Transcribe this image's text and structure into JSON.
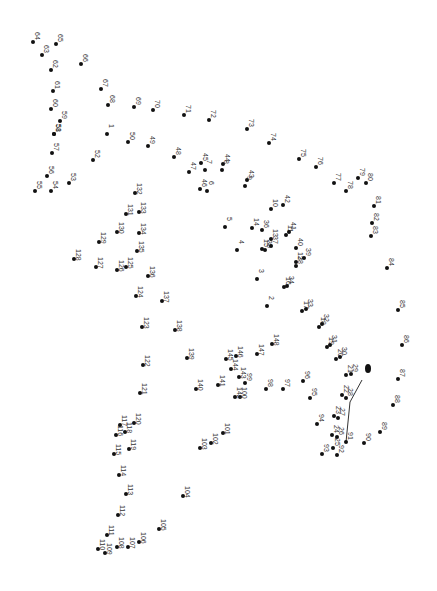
{
  "puzzle": {
    "type": "connect-the-dots",
    "dots": [
      {
        "n": "1",
        "x": 107,
        "y": 134
      },
      {
        "n": "2",
        "x": 267,
        "y": 306
      },
      {
        "n": "3",
        "x": 257,
        "y": 279
      },
      {
        "n": "4",
        "x": 237,
        "y": 250
      },
      {
        "n": "5",
        "x": 225,
        "y": 227
      },
      {
        "n": "6",
        "x": 207,
        "y": 191
      },
      {
        "n": "7",
        "x": 205,
        "y": 170
      },
      {
        "n": "8",
        "x": 222,
        "y": 170
      },
      {
        "n": "9",
        "x": 245,
        "y": 186
      },
      {
        "n": "10",
        "x": 271,
        "y": 209
      },
      {
        "n": "11",
        "x": 286,
        "y": 235
      },
      {
        "n": "12",
        "x": 296,
        "y": 262
      },
      {
        "n": "13",
        "x": 271,
        "y": 239
      },
      {
        "n": "14",
        "x": 252,
        "y": 228
      },
      {
        "n": "15",
        "x": 262,
        "y": 249
      },
      {
        "n": "16",
        "x": 284,
        "y": 287
      },
      {
        "n": "17",
        "x": 302,
        "y": 311
      },
      {
        "n": "18",
        "x": 319,
        "y": 327
      },
      {
        "n": "19",
        "x": 327,
        "y": 347
      },
      {
        "n": "20",
        "x": 336,
        "y": 359
      },
      {
        "n": "21",
        "x": 346,
        "y": 375
      },
      {
        "n": "22",
        "x": 342,
        "y": 395
      },
      {
        "n": "23",
        "x": 334,
        "y": 416
      },
      {
        "n": "24",
        "x": 332,
        "y": 435
      },
      {
        "n": "25",
        "x": 333,
        "y": 448
      },
      {
        "n": "26",
        "x": 337,
        "y": 437
      },
      {
        "n": "27",
        "x": 338,
        "y": 418
      },
      {
        "n": "28",
        "x": 346,
        "y": 398
      },
      {
        "n": "29",
        "x": 351,
        "y": 374
      },
      {
        "n": "30",
        "x": 340,
        "y": 357
      },
      {
        "n": "31",
        "x": 330,
        "y": 345
      },
      {
        "n": "32",
        "x": 322,
        "y": 324
      },
      {
        "n": "33",
        "x": 306,
        "y": 309
      },
      {
        "n": "34",
        "x": 287,
        "y": 286
      },
      {
        "n": "35",
        "x": 265,
        "y": 250
      },
      {
        "n": "36",
        "x": 262,
        "y": 230
      },
      {
        "n": "37",
        "x": 271,
        "y": 246
      },
      {
        "n": "38",
        "x": 296,
        "y": 266
      },
      {
        "n": "39",
        "x": 304,
        "y": 258
      },
      {
        "n": "40",
        "x": 296,
        "y": 248
      },
      {
        "n": "41",
        "x": 289,
        "y": 232
      },
      {
        "n": "42",
        "x": 283,
        "y": 205
      },
      {
        "n": "43",
        "x": 247,
        "y": 180
      },
      {
        "n": "44",
        "x": 223,
        "y": 164
      },
      {
        "n": "45",
        "x": 201,
        "y": 163
      },
      {
        "n": "46",
        "x": 200,
        "y": 189
      },
      {
        "n": "47",
        "x": 189,
        "y": 172
      },
      {
        "n": "48",
        "x": 174,
        "y": 157
      },
      {
        "n": "49",
        "x": 148,
        "y": 146
      },
      {
        "n": "50",
        "x": 128,
        "y": 142
      },
      {
        "n": "51",
        "x": 54,
        "y": 134
      },
      {
        "n": "52",
        "x": 93,
        "y": 160
      },
      {
        "n": "53",
        "x": 69,
        "y": 183
      },
      {
        "n": "54",
        "x": 51,
        "y": 191
      },
      {
        "n": "55",
        "x": 35,
        "y": 191
      },
      {
        "n": "56",
        "x": 47,
        "y": 176
      },
      {
        "n": "57",
        "x": 52,
        "y": 153
      },
      {
        "n": "58",
        "x": 54,
        "y": 134
      },
      {
        "n": "59",
        "x": 60,
        "y": 121
      },
      {
        "n": "60",
        "x": 51,
        "y": 109
      },
      {
        "n": "61",
        "x": 53,
        "y": 91
      },
      {
        "n": "62",
        "x": 51,
        "y": 70
      },
      {
        "n": "63",
        "x": 42,
        "y": 55
      },
      {
        "n": "64",
        "x": 33,
        "y": 42
      },
      {
        "n": "65",
        "x": 56,
        "y": 44
      },
      {
        "n": "66",
        "x": 81,
        "y": 64
      },
      {
        "n": "67",
        "x": 101,
        "y": 89
      },
      {
        "n": "68",
        "x": 108,
        "y": 105
      },
      {
        "n": "69",
        "x": 134,
        "y": 107
      },
      {
        "n": "70",
        "x": 153,
        "y": 110
      },
      {
        "n": "71",
        "x": 184,
        "y": 115
      },
      {
        "n": "72",
        "x": 209,
        "y": 120
      },
      {
        "n": "73",
        "x": 247,
        "y": 129
      },
      {
        "n": "74",
        "x": 269,
        "y": 143
      },
      {
        "n": "75",
        "x": 299,
        "y": 159
      },
      {
        "n": "76",
        "x": 316,
        "y": 167
      },
      {
        "n": "77",
        "x": 334,
        "y": 183
      },
      {
        "n": "78",
        "x": 346,
        "y": 191
      },
      {
        "n": "79",
        "x": 358,
        "y": 178
      },
      {
        "n": "80",
        "x": 366,
        "y": 183
      },
      {
        "n": "81",
        "x": 374,
        "y": 206
      },
      {
        "n": "82",
        "x": 372,
        "y": 223
      },
      {
        "n": "83",
        "x": 371,
        "y": 236
      },
      {
        "n": "84",
        "x": 387,
        "y": 268
      },
      {
        "n": "85",
        "x": 398,
        "y": 310
      },
      {
        "n": "86",
        "x": 402,
        "y": 345
      },
      {
        "n": "87",
        "x": 398,
        "y": 379
      },
      {
        "n": "88",
        "x": 393,
        "y": 405
      },
      {
        "n": "89",
        "x": 380,
        "y": 432
      },
      {
        "n": "90",
        "x": 364,
        "y": 443
      },
      {
        "n": "91",
        "x": 346,
        "y": 442
      },
      {
        "n": "92",
        "x": 337,
        "y": 455
      },
      {
        "n": "93",
        "x": 322,
        "y": 454
      },
      {
        "n": "94",
        "x": 317,
        "y": 424
      },
      {
        "n": "95",
        "x": 310,
        "y": 398
      },
      {
        "n": "96",
        "x": 303,
        "y": 381
      },
      {
        "n": "97",
        "x": 283,
        "y": 389
      },
      {
        "n": "98",
        "x": 266,
        "y": 389
      },
      {
        "n": "99",
        "x": 245,
        "y": 383
      },
      {
        "n": "100",
        "x": 240,
        "y": 397
      },
      {
        "n": "101",
        "x": 223,
        "y": 433
      },
      {
        "n": "102",
        "x": 211,
        "y": 443
      },
      {
        "n": "103",
        "x": 200,
        "y": 448
      },
      {
        "n": "104",
        "x": 183,
        "y": 496
      },
      {
        "n": "105",
        "x": 159,
        "y": 529
      },
      {
        "n": "106",
        "x": 139,
        "y": 542
      },
      {
        "n": "107",
        "x": 128,
        "y": 547
      },
      {
        "n": "108",
        "x": 117,
        "y": 547
      },
      {
        "n": "109",
        "x": 105,
        "y": 553
      },
      {
        "n": "110",
        "x": 98,
        "y": 549
      },
      {
        "n": "111",
        "x": 107,
        "y": 535
      },
      {
        "n": "112",
        "x": 118,
        "y": 515
      },
      {
        "n": "113",
        "x": 126,
        "y": 494
      },
      {
        "n": "114",
        "x": 119,
        "y": 475
      },
      {
        "n": "115",
        "x": 114,
        "y": 454
      },
      {
        "n": "116",
        "x": 116,
        "y": 435
      },
      {
        "n": "117",
        "x": 120,
        "y": 425
      },
      {
        "n": "118",
        "x": 125,
        "y": 432
      },
      {
        "n": "119",
        "x": 129,
        "y": 449
      },
      {
        "n": "120",
        "x": 134,
        "y": 423
      },
      {
        "n": "121",
        "x": 140,
        "y": 393
      },
      {
        "n": "122",
        "x": 143,
        "y": 365
      },
      {
        "n": "123",
        "x": 142,
        "y": 327
      },
      {
        "n": "124",
        "x": 136,
        "y": 296
      },
      {
        "n": "125",
        "x": 126,
        "y": 267
      },
      {
        "n": "126",
        "x": 117,
        "y": 270
      },
      {
        "n": "127",
        "x": 96,
        "y": 267
      },
      {
        "n": "128",
        "x": 74,
        "y": 259
      },
      {
        "n": "129",
        "x": 99,
        "y": 242
      },
      {
        "n": "130",
        "x": 117,
        "y": 232
      },
      {
        "n": "131",
        "x": 126,
        "y": 214
      },
      {
        "n": "132",
        "x": 135,
        "y": 193
      },
      {
        "n": "133",
        "x": 139,
        "y": 212
      },
      {
        "n": "134",
        "x": 139,
        "y": 233
      },
      {
        "n": "135",
        "x": 137,
        "y": 251
      },
      {
        "n": "136",
        "x": 148,
        "y": 276
      },
      {
        "n": "137",
        "x": 162,
        "y": 301
      },
      {
        "n": "138",
        "x": 175,
        "y": 330
      },
      {
        "n": "139",
        "x": 187,
        "y": 358
      },
      {
        "n": "140",
        "x": 196,
        "y": 389
      },
      {
        "n": "141",
        "x": 218,
        "y": 385
      },
      {
        "n": "142",
        "x": 235,
        "y": 397
      },
      {
        "n": "143",
        "x": 239,
        "y": 377
      },
      {
        "n": "144",
        "x": 231,
        "y": 369
      },
      {
        "n": "145",
        "x": 226,
        "y": 359
      },
      {
        "n": "146",
        "x": 236,
        "y": 356
      },
      {
        "n": "147",
        "x": 257,
        "y": 354
      },
      {
        "n": "148",
        "x": 272,
        "y": 344
      }
    ],
    "eye": {
      "x": 368,
      "y": 368
    },
    "mouth_line": [
      [
        362,
        380
      ],
      [
        350,
        402
      ],
      [
        346,
        442
      ]
    ],
    "line_color": "#333333",
    "dot_color": "#111111"
  }
}
